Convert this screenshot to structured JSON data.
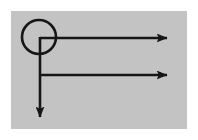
{
  "figure": {
    "background_color": "#ffffff",
    "panel_color": "#c3c3c3",
    "stroke_color": "#161616",
    "panel": {
      "x": 11,
      "y": 11,
      "width": 176,
      "height": 118
    },
    "stroke_width": 2.6,
    "node": {
      "name": "circle-node",
      "center_x": 39,
      "center_y": 37,
      "radius": 17,
      "fill": "none"
    },
    "branches": [
      {
        "name": "upper-right-arrow",
        "direction": "right",
        "x1": 40,
        "y1": 38,
        "x2": 167,
        "y2": 38
      },
      {
        "name": "lower-right-arrow",
        "direction": "right",
        "x1": 40,
        "y1": 75,
        "x2": 167,
        "y2": 75
      },
      {
        "name": "down-arrow",
        "direction": "down",
        "x1": 40,
        "y1": 37,
        "x2": 40,
        "y2": 117
      }
    ],
    "arrowhead": {
      "length": 11,
      "half_width": 4.5
    }
  }
}
